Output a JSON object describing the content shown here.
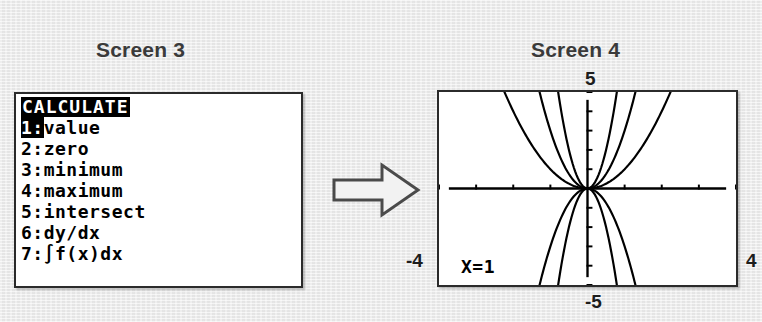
{
  "captions": {
    "left": "Screen 3",
    "right": "Screen 4"
  },
  "arrow": {
    "icon": "right-arrow-icon",
    "fill": "#f2f2f2",
    "stroke": "#4a4a4a"
  },
  "screen3": {
    "menu_title": "CALCULATE",
    "items": [
      {
        "key": "1:",
        "label": "value",
        "selected": true
      },
      {
        "key": "2:",
        "label": "zero",
        "selected": false
      },
      {
        "key": "3:",
        "label": "minimum",
        "selected": false
      },
      {
        "key": "4:",
        "label": "maximum",
        "selected": false
      },
      {
        "key": "5:",
        "label": "intersect",
        "selected": false
      },
      {
        "key": "6:",
        "label": "dy/dx",
        "selected": false
      },
      {
        "key": "7:",
        "label": "∫f(x)dx",
        "selected": false
      }
    ]
  },
  "screen4": {
    "trace_readout": "X=1",
    "window_labels": {
      "ymax": "5",
      "ymin": "-5",
      "xmin": "-4",
      "xmax": "4"
    }
  },
  "chart_data": {
    "type": "line",
    "title": "",
    "xlabel": "",
    "ylabel": "",
    "xlim": [
      -4,
      4
    ],
    "ylim": [
      -5,
      5
    ],
    "grid": false,
    "legend": "none",
    "axis_ticks": {
      "x": [
        -4,
        -3,
        -2,
        -1,
        0,
        1,
        2,
        3,
        4
      ],
      "y": [
        -5,
        -4,
        -3,
        -2,
        -1,
        0,
        1,
        2,
        3,
        4,
        5
      ]
    },
    "series": [
      {
        "name": "y=x^2",
        "expr_a": 1.0,
        "expr_p": 2
      },
      {
        "name": "y=3x^2",
        "expr_a": 3.0,
        "expr_p": 2
      },
      {
        "name": "y=8x^2",
        "expr_a": 8.0,
        "expr_p": 2
      },
      {
        "name": "y=-3x^2",
        "expr_a": -3.0,
        "expr_p": 2
      },
      {
        "name": "y=-8x^2",
        "expr_a": -8.0,
        "expr_p": 2
      }
    ],
    "colors": {
      "curve": "#000000",
      "axis": "#000000",
      "background": "#ffffff"
    }
  }
}
